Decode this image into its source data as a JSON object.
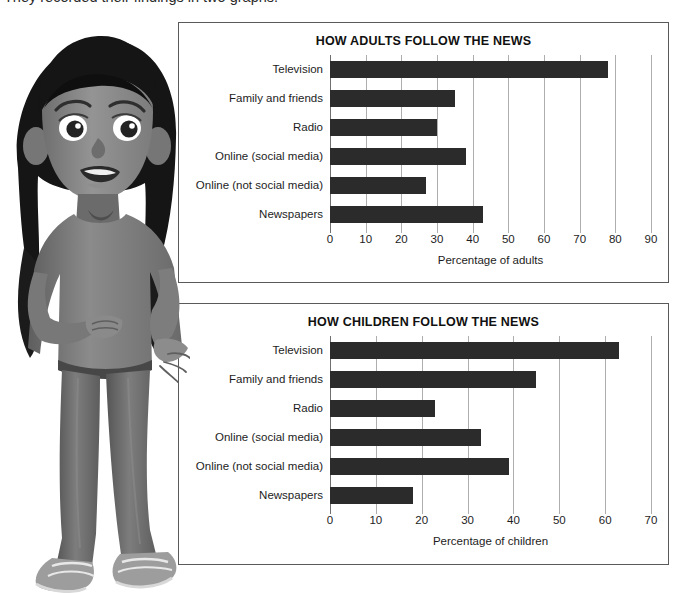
{
  "intro": {
    "text": "They recorded their findings in two graphs."
  },
  "illustration": {
    "name": "girl-character",
    "description": "cartoon girl standing with hand on hip",
    "colors": {
      "hair": "#1a1a1a",
      "skin": "#8d8d8d",
      "top": "#7a7a7a",
      "trousers": "#6a6a6a",
      "shoes": "#9a9a9a"
    }
  },
  "charts": [
    {
      "id": "chart-adults",
      "title": "HOW ADULTS FOLLOW THE NEWS",
      "xlabel": "Percentage of adults",
      "ticks": [
        "0",
        "10",
        "20",
        "30",
        "40",
        "50",
        "60",
        "70",
        "80",
        "90"
      ],
      "categories": [
        "Television",
        "Family and friends",
        "Radio",
        "Online (social media)",
        "Online (not social media)",
        "Newspapers"
      ],
      "values": [
        78,
        35,
        30,
        38,
        27,
        43
      ]
    },
    {
      "id": "chart-children",
      "title": "HOW CHILDREN FOLLOW THE NEWS",
      "xlabel": "Percentage of children",
      "ticks": [
        "0",
        "10",
        "20",
        "30",
        "40",
        "50",
        "60",
        "70"
      ],
      "categories": [
        "Television",
        "Family and friends",
        "Radio",
        "Online (social media)",
        "Online (not social media)",
        "Newspapers"
      ],
      "values": [
        63,
        45,
        23,
        33,
        39,
        18
      ]
    }
  ],
  "chart_data": [
    {
      "type": "bar",
      "orientation": "horizontal",
      "title": "HOW ADULTS FOLLOW THE NEWS",
      "xlabel": "Percentage of adults",
      "ylabel": "",
      "categories": [
        "Television",
        "Family and friends",
        "Radio",
        "Online (social media)",
        "Online (not social media)",
        "Newspapers"
      ],
      "values": [
        78,
        35,
        30,
        38,
        27,
        43
      ],
      "xlim": [
        0,
        90
      ],
      "xticks": [
        0,
        10,
        20,
        30,
        40,
        50,
        60,
        70,
        80,
        90
      ],
      "grid": "vertical",
      "legend": "none",
      "bar_color": "#2b2b2b"
    },
    {
      "type": "bar",
      "orientation": "horizontal",
      "title": "HOW CHILDREN FOLLOW THE NEWS",
      "xlabel": "Percentage of children",
      "ylabel": "",
      "categories": [
        "Television",
        "Family and friends",
        "Radio",
        "Online (social media)",
        "Online (not social media)",
        "Newspapers"
      ],
      "values": [
        63,
        45,
        23,
        33,
        39,
        18
      ],
      "xlim": [
        0,
        70
      ],
      "xticks": [
        0,
        10,
        20,
        30,
        40,
        50,
        60,
        70
      ],
      "grid": "vertical",
      "legend": "none",
      "bar_color": "#2b2b2b"
    }
  ]
}
